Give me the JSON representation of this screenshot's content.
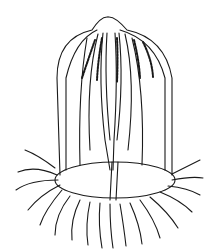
{
  "image": {
    "subject": "jellyfish line drawing",
    "description": "Black and white engraving of a hydromedusa with bell, gonads and trailing tentacles",
    "colors": {
      "ink": "#1a1a1a",
      "background": "#ffffff"
    }
  }
}
